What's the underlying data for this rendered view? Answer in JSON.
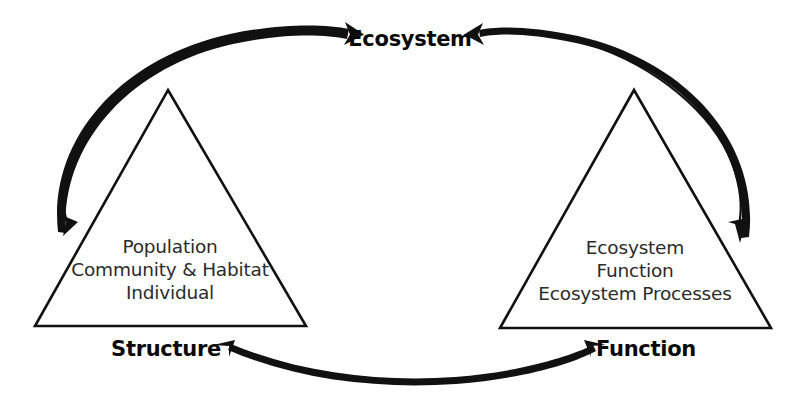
{
  "diagram": {
    "background_color": "#ffffff",
    "line_color": "#111111",
    "text_color": "#2b2b2b",
    "label_color": "#0a0a0a",
    "nodes": {
      "top": {
        "label": "Ecosystem"
      },
      "left": {
        "label": "Structure"
      },
      "right": {
        "label": "Function"
      }
    },
    "left_triangle": {
      "name": "structure-triangle",
      "lines": [
        "Population",
        "Community & Habitat",
        "Individual"
      ]
    },
    "right_triangle": {
      "name": "function-triangle",
      "lines": [
        "Ecosystem",
        "Function",
        "Ecosystem Processes"
      ]
    },
    "arrows": [
      {
        "name": "structure-to-ecosystem-arc",
        "from": "Structure",
        "to": "Ecosystem",
        "direction": "up-right"
      },
      {
        "name": "ecosystem-to-structure-arc",
        "from": "Ecosystem",
        "to": "Structure",
        "direction": "down-left"
      },
      {
        "name": "function-to-ecosystem-arc",
        "from": "Function",
        "to": "Ecosystem",
        "direction": "up-left"
      },
      {
        "name": "ecosystem-to-function-arc",
        "from": "Ecosystem",
        "to": "Function",
        "direction": "down-right"
      },
      {
        "name": "structure-function-arc",
        "from": "Structure",
        "to": "Function",
        "direction": "bidirectional"
      }
    ]
  }
}
